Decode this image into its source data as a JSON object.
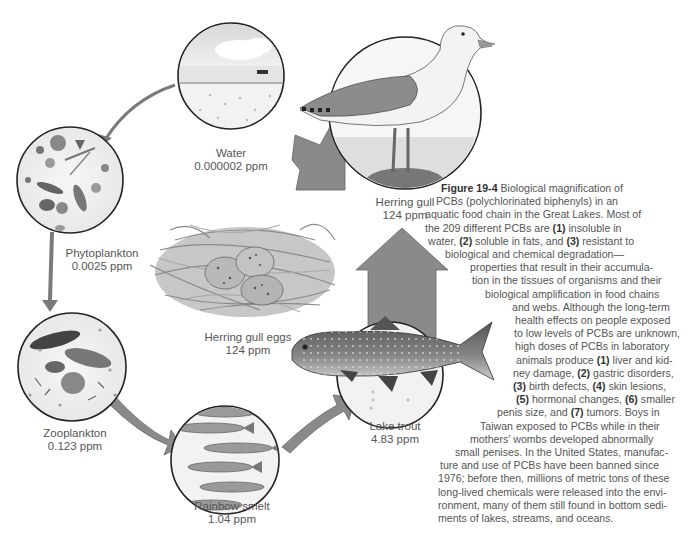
{
  "figure": {
    "number": "Figure 19-4",
    "caption_lines": [
      {
        "segments": [
          {
            "t": "Figure 19-4",
            "b": true
          },
          {
            "t": "  Biological magnification of",
            "b": false
          }
        ]
      },
      {
        "segments": [
          {
            "t": "PCBs (polychlorinated biphenyls) in an",
            "b": false
          }
        ]
      },
      {
        "segments": [
          {
            "t": "aquatic food chain in the Great Lakes. Most of",
            "b": false
          }
        ]
      },
      {
        "segments": [
          {
            "t": "the 209 different PCBs are ",
            "b": false
          },
          {
            "t": "(1)",
            "b": true
          },
          {
            "t": " insoluble in",
            "b": false
          }
        ]
      },
      {
        "segments": [
          {
            "t": "water, ",
            "b": false
          },
          {
            "t": "(2)",
            "b": true
          },
          {
            "t": " soluble in fats, and ",
            "b": false
          },
          {
            "t": "(3)",
            "b": true
          },
          {
            "t": " resistant to",
            "b": false
          }
        ]
      },
      {
        "segments": [
          {
            "t": "biological and chemical degradation—",
            "b": false
          }
        ]
      },
      {
        "segments": [
          {
            "t": "properties that result in their accumula-",
            "b": false
          }
        ]
      },
      {
        "segments": [
          {
            "t": "tion in the tissues of organisms and their",
            "b": false
          }
        ]
      },
      {
        "segments": [
          {
            "t": "biological amplification in food chains",
            "b": false
          }
        ]
      },
      {
        "segments": [
          {
            "t": "and webs. Although the long-term",
            "b": false
          }
        ]
      },
      {
        "segments": [
          {
            "t": "health effects on people exposed",
            "b": false
          }
        ]
      },
      {
        "segments": [
          {
            "t": "to low levels of PCBs are unknown,",
            "b": false
          }
        ]
      },
      {
        "segments": [
          {
            "t": "high doses of PCBs in laboratory",
            "b": false
          }
        ]
      },
      {
        "segments": [
          {
            "t": "animals produce ",
            "b": false
          },
          {
            "t": "(1)",
            "b": true
          },
          {
            "t": " liver and kid-",
            "b": false
          }
        ]
      },
      {
        "segments": [
          {
            "t": "ney damage, ",
            "b": false
          },
          {
            "t": "(2)",
            "b": true
          },
          {
            "t": " gastric disorders,",
            "b": false
          }
        ]
      },
      {
        "segments": [
          {
            "t": "(3)",
            "b": true
          },
          {
            "t": " birth defects, ",
            "b": false
          },
          {
            "t": "(4)",
            "b": true
          },
          {
            "t": " skin lesions,",
            "b": false
          }
        ]
      },
      {
        "segments": [
          {
            "t": "(5)",
            "b": true
          },
          {
            "t": " hormonal changes, ",
            "b": false
          },
          {
            "t": "(6)",
            "b": true
          },
          {
            "t": " smaller",
            "b": false
          }
        ]
      },
      {
        "segments": [
          {
            "t": "penis size, and ",
            "b": false
          },
          {
            "t": "(7)",
            "b": true
          },
          {
            "t": " tumors. Boys in",
            "b": false
          }
        ]
      },
      {
        "segments": [
          {
            "t": "Taiwan exposed to PCBs while in their",
            "b": false
          }
        ]
      },
      {
        "segments": [
          {
            "t": "mothers' wombs developed abnormally",
            "b": false
          }
        ]
      },
      {
        "segments": [
          {
            "t": "small penises. In the United States, manufac-",
            "b": false
          }
        ]
      },
      {
        "segments": [
          {
            "t": "ture and use of PCBs have been banned since",
            "b": false
          }
        ]
      },
      {
        "segments": [
          {
            "t": "1976; before then, millions of metric tons of these",
            "b": false
          }
        ]
      },
      {
        "segments": [
          {
            "t": "long-lived chemicals were released into the envi-",
            "b": false
          }
        ]
      },
      {
        "segments": [
          {
            "t": "ronment, many of them still found in bottom sedi-",
            "b": false
          }
        ]
      },
      {
        "segments": [
          {
            "t": "ments of lakes, streams, and oceans.",
            "b": false
          }
        ]
      }
    ]
  },
  "nodes": {
    "water": {
      "name": "Water",
      "value": "0.000002 ppm"
    },
    "phytoplankton": {
      "name": "Phytoplankton",
      "value": "0.0025 ppm"
    },
    "zooplankton": {
      "name": "Zooplankton",
      "value": "0.123 ppm"
    },
    "rainbow_smelt": {
      "name": "Rainbow smelt",
      "value": "1.04 ppm"
    },
    "lake_trout": {
      "name": "Lake trout",
      "value": "4.83 ppm"
    },
    "herring_gull": {
      "name": "Herring gull",
      "value": "124 ppm"
    },
    "herring_gull_eggs": {
      "name": "Herring gull eggs",
      "value": "124 ppm"
    }
  },
  "colors": {
    "arrow": "#8a8a8a",
    "arrow_stroke": "#5a5a5a",
    "circle_stroke": "#222222",
    "circle_fill": "#f2f2f2",
    "text": "#555555"
  }
}
